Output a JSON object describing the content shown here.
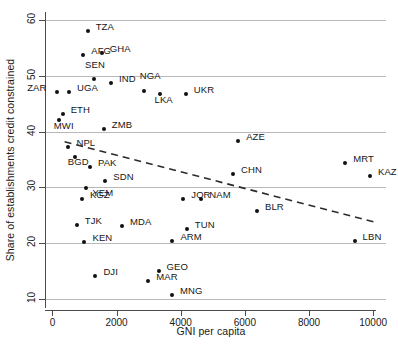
{
  "chart_data": {
    "type": "scatter",
    "title": "",
    "xlabel": "GNI per capita",
    "ylabel": "Share of establishments credit constrained",
    "xlim": [
      -200,
      10400
    ],
    "ylim": [
      8.5,
      61.5
    ],
    "xticks": [
      0,
      2000,
      4000,
      6000,
      8000,
      10000
    ],
    "yticks": [
      10,
      20,
      30,
      40,
      50,
      60
    ],
    "grid": "horizontal",
    "legend": "none",
    "point_color": "#111111",
    "grid_color": "#b9b9b9",
    "trendline": {
      "style": "dashed",
      "color": "#2b2b2b",
      "x_start": 380,
      "y_start": 38.2,
      "x_end": 10150,
      "y_end": 23.6
    },
    "points": [
      {
        "label": "TZA",
        "x": 1100,
        "y": 58.0,
        "lx": 8,
        "ly": -5
      },
      {
        "label": "AFG",
        "x": 960,
        "y": 53.7,
        "lx": 8,
        "ly": -5
      },
      {
        "label": "GHA",
        "x": 1540,
        "y": 54.2,
        "lx": 8,
        "ly": -5
      },
      {
        "label": "SEN",
        "x": 1300,
        "y": 49.4,
        "lx": -9,
        "ly": -15
      },
      {
        "label": "IND",
        "x": 1830,
        "y": 48.8,
        "lx": 8,
        "ly": -5
      },
      {
        "label": "NGA",
        "x": 2850,
        "y": 47.3,
        "lx": -4,
        "ly": -16
      },
      {
        "label": "ZAR",
        "x": 150,
        "y": 47.2,
        "lx": -31,
        "ly": -5
      },
      {
        "label": "UGA",
        "x": 520,
        "y": 47.2,
        "lx": 8,
        "ly": -5
      },
      {
        "label": "LKA",
        "x": 3340,
        "y": 46.8,
        "lx": -5,
        "ly": 5
      },
      {
        "label": "UKR",
        "x": 4160,
        "y": 46.8,
        "lx": 8,
        "ly": -5
      },
      {
        "label": "ETH",
        "x": 320,
        "y": 43.2,
        "lx": 8,
        "ly": -5
      },
      {
        "label": "MWI",
        "x": 200,
        "y": 42.1,
        "lx": -5,
        "ly": 5
      },
      {
        "label": "ZMB",
        "x": 1600,
        "y": 40.4,
        "lx": 8,
        "ly": -5
      },
      {
        "label": "AZE",
        "x": 5790,
        "y": 38.4,
        "lx": 8,
        "ly": -5
      },
      {
        "label": "NPL",
        "x": 500,
        "y": 37.2,
        "lx": 8,
        "ly": -5
      },
      {
        "label": "BGD",
        "x": 700,
        "y": 35.5,
        "lx": -7,
        "ly": 4
      },
      {
        "label": "PAK",
        "x": 1170,
        "y": 33.7,
        "lx": 8,
        "ly": -5
      },
      {
        "label": "MRT",
        "x": 9130,
        "y": 34.3,
        "lx": 8,
        "ly": -5
      },
      {
        "label": "CHN",
        "x": 5630,
        "y": 32.4,
        "lx": 8,
        "ly": -5
      },
      {
        "label": "KAZ",
        "x": 9900,
        "y": 32.0,
        "lx": 8,
        "ly": -5
      },
      {
        "label": "SDN",
        "x": 1650,
        "y": 31.1,
        "lx": 8,
        "ly": -5
      },
      {
        "label": "YEM",
        "x": 1060,
        "y": 29.9,
        "lx": 6,
        "ly": 4
      },
      {
        "label": "KGZ",
        "x": 920,
        "y": 27.9,
        "lx": 8,
        "ly": -5
      },
      {
        "label": "NAM",
        "x": 4640,
        "y": 27.9,
        "lx": 8,
        "ly": -5
      },
      {
        "label": "JOR",
        "x": 4080,
        "y": 27.9,
        "lx": 8,
        "ly": -5
      },
      {
        "label": "BLR",
        "x": 6380,
        "y": 25.8,
        "lx": 8,
        "ly": -5
      },
      {
        "label": "TJK",
        "x": 760,
        "y": 23.3,
        "lx": 8,
        "ly": -5
      },
      {
        "label": "MDA",
        "x": 2170,
        "y": 23.0,
        "lx": 8,
        "ly": -5
      },
      {
        "label": "TUN",
        "x": 4190,
        "y": 22.5,
        "lx": 8,
        "ly": -5
      },
      {
        "label": "KEN",
        "x": 1000,
        "y": 20.2,
        "lx": 8,
        "ly": -5
      },
      {
        "label": "ARM",
        "x": 3740,
        "y": 20.4,
        "lx": 8,
        "ly": -5
      },
      {
        "label": "LBN",
        "x": 9420,
        "y": 20.3,
        "lx": 8,
        "ly": -5
      },
      {
        "label": "GEO",
        "x": 3310,
        "y": 15.0,
        "lx": 8,
        "ly": -5
      },
      {
        "label": "DJI",
        "x": 1340,
        "y": 14.0,
        "lx": 8,
        "ly": -5
      },
      {
        "label": "MAR",
        "x": 2990,
        "y": 13.2,
        "lx": 8,
        "ly": -5
      },
      {
        "label": "MNG",
        "x": 3730,
        "y": 10.6,
        "lx": 8,
        "ly": -5
      }
    ]
  }
}
